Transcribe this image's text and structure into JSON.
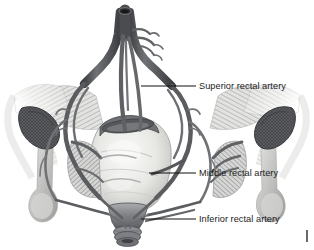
{
  "figure": {
    "background_color": "#ffffff",
    "width": 314,
    "height": 250,
    "style": "grayscale medical illustration"
  },
  "labels": [
    {
      "id": "superior-rectal-artery",
      "text": "Superior rectal artery",
      "text_x": 199,
      "text_y": 89,
      "leader": {
        "x1": 141,
        "y1": 86,
        "x2": 196,
        "y2": 86
      }
    },
    {
      "id": "middle-rectal-artery",
      "text": "Middle rectal artery",
      "text_x": 199,
      "text_y": 176,
      "leader": {
        "x1": 149,
        "y1": 173,
        "x2": 196,
        "y2": 173
      }
    },
    {
      "id": "inferior-rectal-artery",
      "text": "Inferior rectal artery",
      "text_x": 199,
      "text_y": 222,
      "leader": {
        "x1": 141,
        "y1": 219,
        "x2": 196,
        "y2": 219
      }
    }
  ],
  "edge_mark": {
    "id": "right-edge-tick",
    "x": 307,
    "y1": 230,
    "y2": 242
  },
  "anatomy": {
    "parts": [
      {
        "id": "superior-rectal-trunk",
        "name": "Superior rectal artery trunk",
        "tone": "#595b5e"
      },
      {
        "id": "artery-network",
        "name": "Rectal arterial network",
        "tone": "#6a6c70"
      },
      {
        "id": "rectum-ampulla",
        "name": "Rectal ampulla / pelvic viscus",
        "tone": "#e8e8e6"
      },
      {
        "id": "levator-ani-left",
        "name": "Levator ani muscle (left)",
        "tone": "#c9c9c7"
      },
      {
        "id": "levator-ani-right",
        "name": "Levator ani muscle (right)",
        "tone": "#c9c9c7"
      },
      {
        "id": "ischioanal-left",
        "name": "Ischioanal structure (left)",
        "tone": "#5d5f62"
      },
      {
        "id": "ischioanal-right",
        "name": "Ischioanal structure (right)",
        "tone": "#5d5f62"
      },
      {
        "id": "ischial-tuberosity-left",
        "name": "Ischial tuberosity (left)",
        "tone": "#b9b9b7"
      },
      {
        "id": "ischial-tuberosity-right",
        "name": "Ischial tuberosity (right)",
        "tone": "#b9b9b7"
      },
      {
        "id": "anal-canal",
        "name": "Anal canal and sphincter",
        "tone": "#8d8f92"
      }
    ]
  },
  "colors": {
    "background": "#ffffff",
    "label_text": "#1c1c1c",
    "leader_line": "#111111",
    "artery_dark": "#4e5053",
    "artery_mid": "#6f7174",
    "organ_light": "#efefed",
    "muscle_gray": "#c4c4c2",
    "bone_gray": "#b5b5b3"
  }
}
